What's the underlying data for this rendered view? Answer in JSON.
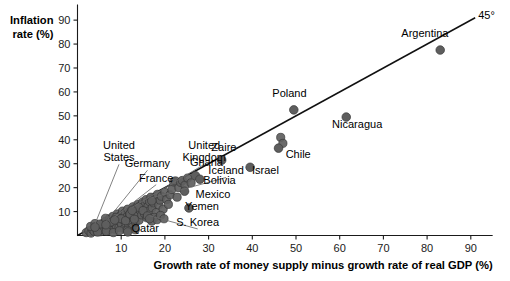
{
  "chart_data": {
    "type": "scatter",
    "title": "",
    "ylabel": "Inflation rate (%)",
    "xlabel": "Growth rate of money supply minus growth rate of real GDP (%)",
    "xlim": [
      0,
      95
    ],
    "ylim": [
      0,
      95
    ],
    "grid": false,
    "legend": "none",
    "x_ticks": [
      10,
      20,
      30,
      40,
      50,
      60,
      70,
      80,
      90
    ],
    "y_ticks": [
      10,
      20,
      30,
      40,
      50,
      60,
      70,
      80,
      90
    ],
    "reference_line": {
      "label": "45°",
      "slope": 1,
      "intercept": 0,
      "x_start": 0,
      "x_end": 91
    },
    "labeled_points": [
      {
        "name": "United States",
        "x": 4.0,
        "y": 3.5,
        "label_x": 9.5,
        "label_y": 36.0,
        "label_line2": "States",
        "leader": true
      },
      {
        "name": "Germany",
        "x": 6.5,
        "y": 4.5,
        "label_x": 16.0,
        "label_y": 28.5,
        "leader": true
      },
      {
        "name": "France",
        "x": 8.5,
        "y": 6.5,
        "label_x": 18.0,
        "label_y": 22.5,
        "leader": true
      },
      {
        "name": "United Kingdom",
        "x": 12.5,
        "y": 10.5,
        "label_x": 29.0,
        "label_y": 36.0,
        "label_line2": "Kingdom",
        "leader": true
      },
      {
        "name": "Iceland",
        "x": 17.0,
        "y": 14.5,
        "label_x": 34.0,
        "label_y": 25.5,
        "leader": true
      },
      {
        "name": "Qatar",
        "x": 11.5,
        "y": 1.5,
        "label_x": 15.5,
        "label_y": 1.5,
        "leader": false
      },
      {
        "name": "S. Korea",
        "x": 16.5,
        "y": 7.0,
        "label_x": 27.5,
        "label_y": 4.0,
        "leader": true
      },
      {
        "name": "Mexico",
        "x": 24.5,
        "y": 18.5,
        "label_x": 31.0,
        "label_y": 15.5,
        "leader": false
      },
      {
        "name": "Yemen",
        "x": 25.5,
        "y": 11.5,
        "label_x": 28.5,
        "label_y": 10.5,
        "leader": false
      },
      {
        "name": "Ghana",
        "x": 27.0,
        "y": 25.0,
        "label_x": 29.5,
        "label_y": 29.0,
        "leader": false
      },
      {
        "name": "Bolivia",
        "x": 28.0,
        "y": 23.5,
        "label_x": 32.5,
        "label_y": 21.5,
        "leader": false
      },
      {
        "name": "Zaire",
        "x": 33.0,
        "y": 31.5,
        "label_x": 33.5,
        "label_y": 35.5,
        "leader": false
      },
      {
        "name": "Israel",
        "x": 39.5,
        "y": 28.5,
        "label_x": 43.0,
        "label_y": 25.5,
        "leader": false
      },
      {
        "name": "Chile",
        "x": 46.0,
        "y": 36.5,
        "label_x": 50.5,
        "label_y": 32.5,
        "leader": false
      },
      {
        "name": "Poland",
        "x": 49.5,
        "y": 52.5,
        "label_x": 48.5,
        "label_y": 58.0,
        "leader": false
      },
      {
        "name": "Nicaragua",
        "x": 61.5,
        "y": 49.5,
        "label_x": 64.0,
        "label_y": 45.0,
        "leader": false
      },
      {
        "name": "Argentina",
        "x": 83.0,
        "y": 77.5,
        "label_x": 79.5,
        "label_y": 83.0,
        "leader": false
      }
    ],
    "unlabeled_points": [
      [
        2.0,
        1.2
      ],
      [
        2.6,
        2.0
      ],
      [
        3.1,
        1.0
      ],
      [
        3.4,
        2.6
      ],
      [
        3.8,
        1.8
      ],
      [
        4.2,
        3.0
      ],
      [
        4.5,
        2.0
      ],
      [
        4.8,
        4.0
      ],
      [
        5.0,
        2.8
      ],
      [
        5.3,
        1.6
      ],
      [
        5.5,
        3.6
      ],
      [
        5.8,
        5.0
      ],
      [
        6.0,
        2.4
      ],
      [
        6.2,
        4.4
      ],
      [
        6.5,
        6.0
      ],
      [
        6.7,
        3.2
      ],
      [
        6.9,
        5.4
      ],
      [
        7.1,
        2.2
      ],
      [
        7.3,
        7.0
      ],
      [
        7.5,
        4.2
      ],
      [
        7.7,
        6.2
      ],
      [
        7.9,
        3.0
      ],
      [
        8.1,
        8.0
      ],
      [
        8.3,
        5.2
      ],
      [
        8.5,
        2.6
      ],
      [
        8.7,
        6.8
      ],
      [
        8.9,
        4.0
      ],
      [
        9.1,
        9.0
      ],
      [
        9.3,
        7.4
      ],
      [
        9.5,
        3.4
      ],
      [
        9.7,
        5.8
      ],
      [
        9.9,
        8.4
      ],
      [
        10.1,
        4.6
      ],
      [
        10.3,
        10.2
      ],
      [
        10.5,
        6.6
      ],
      [
        10.7,
        2.8
      ],
      [
        10.9,
        9.4
      ],
      [
        11.1,
        5.0
      ],
      [
        11.3,
        7.8
      ],
      [
        11.5,
        11.0
      ],
      [
        11.7,
        4.0
      ],
      [
        11.9,
        8.8
      ],
      [
        12.1,
        6.0
      ],
      [
        12.3,
        10.0
      ],
      [
        12.5,
        3.4
      ],
      [
        12.7,
        12.0
      ],
      [
        12.9,
        7.2
      ],
      [
        13.1,
        9.6
      ],
      [
        13.3,
        5.6
      ],
      [
        13.5,
        11.4
      ],
      [
        13.7,
        8.0
      ],
      [
        13.9,
        13.0
      ],
      [
        14.1,
        6.4
      ],
      [
        14.3,
        10.6
      ],
      [
        14.5,
        12.4
      ],
      [
        14.7,
        8.6
      ],
      [
        14.9,
        14.0
      ],
      [
        15.1,
        11.0
      ],
      [
        15.3,
        9.2
      ],
      [
        15.5,
        13.2
      ],
      [
        15.7,
        15.0
      ],
      [
        15.9,
        7.4
      ],
      [
        16.1,
        12.0
      ],
      [
        16.3,
        10.2
      ],
      [
        16.5,
        14.2
      ],
      [
        16.8,
        16.0
      ],
      [
        17.1,
        11.6
      ],
      [
        17.4,
        13.6
      ],
      [
        17.7,
        15.4
      ],
      [
        18.0,
        9.6
      ],
      [
        18.3,
        17.2
      ],
      [
        18.6,
        12.8
      ],
      [
        18.9,
        14.8
      ],
      [
        19.2,
        16.4
      ],
      [
        19.6,
        11.0
      ],
      [
        20.0,
        18.0
      ],
      [
        20.4,
        15.0
      ],
      [
        20.8,
        13.0
      ],
      [
        21.2,
        17.0
      ],
      [
        21.6,
        19.2
      ],
      [
        22.0,
        22.4
      ],
      [
        22.4,
        22.8
      ],
      [
        22.8,
        16.0
      ],
      [
        23.2,
        20.0
      ],
      [
        23.6,
        22.2
      ],
      [
        24.0,
        23.0
      ],
      [
        24.6,
        21.0
      ],
      [
        25.2,
        24.0
      ],
      [
        26.0,
        22.0
      ],
      [
        3.0,
        3.8
      ],
      [
        4.0,
        5.0
      ],
      [
        5.2,
        4.8
      ],
      [
        6.4,
        7.2
      ],
      [
        7.6,
        5.6
      ],
      [
        8.8,
        7.6
      ],
      [
        10.0,
        7.0
      ],
      [
        11.0,
        6.2
      ],
      [
        12.0,
        9.0
      ],
      [
        13.0,
        6.8
      ],
      [
        14.0,
        11.8
      ],
      [
        15.0,
        10.4
      ],
      [
        16.0,
        8.2
      ],
      [
        17.0,
        6.0
      ],
      [
        17.6,
        7.6
      ],
      [
        18.2,
        6.6
      ],
      [
        19.0,
        8.4
      ],
      [
        19.8,
        7.0
      ],
      [
        4.6,
        1.4
      ],
      [
        6.6,
        1.8
      ],
      [
        8.2,
        1.2
      ],
      [
        9.6,
        2.0
      ],
      [
        11.4,
        2.2
      ],
      [
        13.2,
        2.4
      ],
      [
        46.5,
        41.0
      ],
      [
        47.0,
        38.5
      ]
    ]
  }
}
